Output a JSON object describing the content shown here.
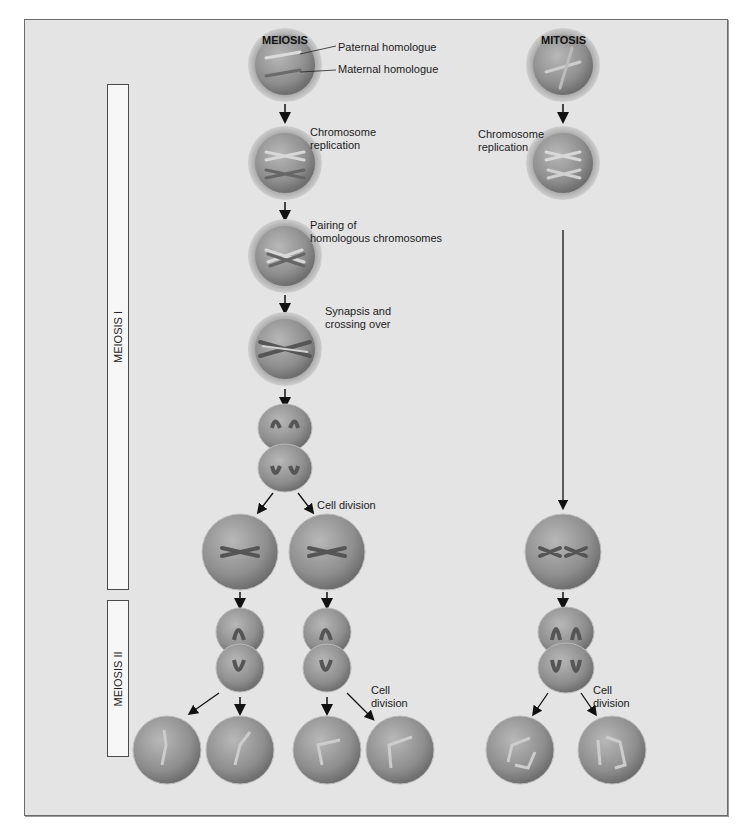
{
  "headers": {
    "meiosis": "MEIOSIS",
    "mitosis": "MITOSIS"
  },
  "phases": {
    "meiosis_1": "MEIOSIS I",
    "meiosis_2": "MEIOSIS II"
  },
  "labels": {
    "paternal": "Paternal homologue",
    "maternal": "Maternal homologue",
    "replication_meiosis": "Chromosome\nreplication",
    "replication_mitosis": "Chromosome\nreplication",
    "pairing": "Pairing of\nhomologous chromosomes",
    "synapsis": "Synapsis and\ncrossing over",
    "cell_division_1": "Cell division",
    "cell_division_2": "Cell\ndivision",
    "cell_division_mitosis": "Cell\ndivision"
  },
  "colors": {
    "background": "#e4e4e4",
    "cell": "#9a9a9a",
    "chromosome": "#5a5a5a",
    "arrow": "#111111"
  }
}
